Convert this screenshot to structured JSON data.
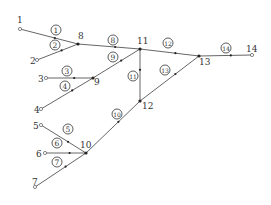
{
  "diagram": {
    "type": "pipe-network",
    "colors": {
      "line": "#555555",
      "node_fill": "#222222",
      "open_node_fill": "#ffffff",
      "text": "#333333"
    },
    "nodes": [
      {
        "id": "1",
        "label": "1",
        "x": 20,
        "y": 29,
        "kind": "source",
        "lx": 17,
        "ly": 23
      },
      {
        "id": "2",
        "label": "2",
        "x": 37,
        "y": 60,
        "kind": "source",
        "lx": 30,
        "ly": 64
      },
      {
        "id": "3",
        "label": "3",
        "x": 46,
        "y": 78,
        "kind": "source",
        "lx": 38,
        "ly": 82
      },
      {
        "id": "4",
        "label": "4",
        "x": 41,
        "y": 109,
        "kind": "source",
        "lx": 34,
        "ly": 113
      },
      {
        "id": "5",
        "label": "5",
        "x": 41,
        "y": 125,
        "kind": "source",
        "lx": 33,
        "ly": 129
      },
      {
        "id": "6",
        "label": "6",
        "x": 45,
        "y": 153,
        "kind": "source",
        "lx": 36,
        "ly": 157
      },
      {
        "id": "7",
        "label": "7",
        "x": 35,
        "y": 187,
        "kind": "source",
        "lx": 32,
        "ly": 185
      },
      {
        "id": "8",
        "label": "8",
        "x": 78,
        "y": 44,
        "kind": "junction",
        "lx": 78,
        "ly": 39
      },
      {
        "id": "9",
        "label": "9",
        "x": 93,
        "y": 78,
        "kind": "junction",
        "lx": 94,
        "ly": 85
      },
      {
        "id": "10",
        "label": "10",
        "x": 86,
        "y": 153,
        "kind": "junction",
        "lx": 80,
        "ly": 148
      },
      {
        "id": "11",
        "label": "11",
        "x": 140,
        "y": 49,
        "kind": "junction",
        "lx": 137,
        "ly": 44
      },
      {
        "id": "12",
        "label": "12",
        "x": 140,
        "y": 101,
        "kind": "junction",
        "lx": 142,
        "ly": 109
      },
      {
        "id": "13",
        "label": "13",
        "x": 199,
        "y": 56,
        "kind": "junction",
        "lx": 199,
        "ly": 65
      },
      {
        "id": "14",
        "label": "14",
        "x": 252,
        "y": 55,
        "kind": "outlet",
        "lx": 246,
        "ly": 52
      }
    ],
    "pipes": [
      {
        "id": "p1",
        "label": "1",
        "from": "1",
        "to": "8",
        "lx": 56,
        "ly": 30
      },
      {
        "id": "p2",
        "label": "2",
        "from": "2",
        "to": "8",
        "lx": 55,
        "ly": 45
      },
      {
        "id": "p3",
        "label": "3",
        "from": "3",
        "to": "9",
        "lx": 67,
        "ly": 71
      },
      {
        "id": "p4",
        "label": "4",
        "from": "4",
        "to": "9",
        "lx": 65,
        "ly": 86
      },
      {
        "id": "p5",
        "label": "5",
        "from": "5",
        "to": "10",
        "lx": 68,
        "ly": 129
      },
      {
        "id": "p6",
        "label": "6",
        "from": "6",
        "to": "10",
        "lx": 57,
        "ly": 143
      },
      {
        "id": "p7",
        "label": "7",
        "from": "7",
        "to": "10",
        "lx": 57,
        "ly": 162
      },
      {
        "id": "p8",
        "label": "8",
        "from": "8",
        "to": "11",
        "lx": 113,
        "ly": 40
      },
      {
        "id": "p9",
        "label": "9",
        "from": "9",
        "to": "11",
        "lx": 113,
        "ly": 57
      },
      {
        "id": "p10",
        "label": "10",
        "from": "10",
        "to": "12",
        "lx": 117,
        "ly": 114
      },
      {
        "id": "p11",
        "label": "11",
        "from": "12",
        "to": "11",
        "lx": 133,
        "ly": 76
      },
      {
        "id": "p12",
        "label": "12",
        "from": "11",
        "to": "13",
        "lx": 168,
        "ly": 43
      },
      {
        "id": "p13",
        "label": "13",
        "from": "12",
        "to": "13",
        "lx": 165,
        "ly": 70
      },
      {
        "id": "p14",
        "label": "14",
        "from": "13",
        "to": "14",
        "lx": 226,
        "ly": 48
      }
    ]
  }
}
